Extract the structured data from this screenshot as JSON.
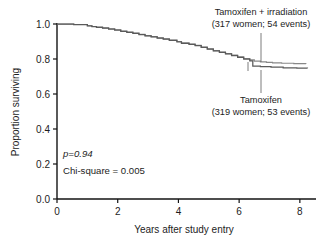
{
  "chart_data": {
    "type": "line",
    "title": "",
    "subtitle": "",
    "xlabel": "Years after study entry",
    "ylabel": "Proportion surviving",
    "xlim": [
      0,
      8.4
    ],
    "ylim": [
      0.0,
      1.04
    ],
    "xticks": [
      "0",
      "2",
      "4",
      "6",
      "8"
    ],
    "xtick_values": [
      0,
      2,
      4,
      6,
      8
    ],
    "yticks": [
      "0.0",
      "0.2",
      "0.4",
      "0.6",
      "0.8",
      "1.0"
    ],
    "ytick_values": [
      0.0,
      0.2,
      0.4,
      0.6,
      0.8,
      1.0
    ],
    "grid": false,
    "legend_position": "inline-annotations",
    "annotations": [
      {
        "name": "tamoxifen-irradiation-label",
        "line1": "Tamoxifen + irradiation",
        "line2": "(317 women; 54 events)",
        "n_women": 317,
        "n_events": 54
      },
      {
        "name": "tamoxifen-label",
        "line1": "Tamoxifen",
        "line2": "(319 women; 53 events)",
        "n_women": 319,
        "n_events": 53
      }
    ],
    "statistics": {
      "p_value_label": "p=0.94",
      "p_value": 0.94,
      "chi_square_label": "Chi-square = 0.005",
      "chi_square": 0.005
    },
    "series": [
      {
        "name": "Tamoxifen + irradiation",
        "color": "#5a5a5a",
        "points": [
          [
            0.0,
            1.0
          ],
          [
            0.45,
            1.0
          ],
          [
            0.55,
            0.997
          ],
          [
            0.9,
            0.997
          ],
          [
            1.0,
            0.99
          ],
          [
            1.15,
            0.986
          ],
          [
            1.3,
            0.983
          ],
          [
            1.5,
            0.978
          ],
          [
            1.7,
            0.973
          ],
          [
            1.9,
            0.967
          ],
          [
            2.1,
            0.96
          ],
          [
            2.3,
            0.954
          ],
          [
            2.5,
            0.948
          ],
          [
            2.7,
            0.941
          ],
          [
            2.9,
            0.934
          ],
          [
            3.1,
            0.928
          ],
          [
            3.3,
            0.921
          ],
          [
            3.5,
            0.915
          ],
          [
            3.7,
            0.908
          ],
          [
            3.95,
            0.9
          ],
          [
            4.1,
            0.892
          ],
          [
            4.35,
            0.885
          ],
          [
            4.55,
            0.878
          ],
          [
            4.75,
            0.868
          ],
          [
            4.95,
            0.858
          ],
          [
            5.15,
            0.848
          ],
          [
            5.35,
            0.84
          ],
          [
            5.55,
            0.831
          ],
          [
            5.75,
            0.822
          ],
          [
            5.95,
            0.812
          ],
          [
            6.15,
            0.803
          ],
          [
            6.35,
            0.795
          ],
          [
            6.5,
            0.788
          ],
          [
            6.7,
            0.784
          ],
          [
            6.9,
            0.781
          ],
          [
            7.1,
            0.778
          ],
          [
            7.4,
            0.776
          ],
          [
            7.8,
            0.774
          ],
          [
            8.2,
            0.773
          ]
        ]
      },
      {
        "name": "Tamoxifen",
        "color": "#7d7d7d",
        "points": [
          [
            0.0,
            1.0
          ],
          [
            0.45,
            1.0
          ],
          [
            0.55,
            0.996
          ],
          [
            0.9,
            0.996
          ],
          [
            1.0,
            0.989
          ],
          [
            1.15,
            0.985
          ],
          [
            1.3,
            0.981
          ],
          [
            1.5,
            0.976
          ],
          [
            1.7,
            0.971
          ],
          [
            1.9,
            0.965
          ],
          [
            2.1,
            0.958
          ],
          [
            2.3,
            0.952
          ],
          [
            2.5,
            0.946
          ],
          [
            2.7,
            0.939
          ],
          [
            2.9,
            0.932
          ],
          [
            3.1,
            0.926
          ],
          [
            3.3,
            0.919
          ],
          [
            3.5,
            0.913
          ],
          [
            3.7,
            0.906
          ],
          [
            3.95,
            0.898
          ],
          [
            4.1,
            0.89
          ],
          [
            4.35,
            0.883
          ],
          [
            4.55,
            0.876
          ],
          [
            4.75,
            0.866
          ],
          [
            4.95,
            0.856
          ],
          [
            5.15,
            0.846
          ],
          [
            5.35,
            0.838
          ],
          [
            5.55,
            0.829
          ],
          [
            5.75,
            0.82
          ],
          [
            5.95,
            0.81
          ],
          [
            6.15,
            0.8
          ],
          [
            6.35,
            0.79
          ],
          [
            6.45,
            0.76
          ],
          [
            6.7,
            0.757
          ],
          [
            7.05,
            0.753
          ],
          [
            7.45,
            0.75
          ],
          [
            7.9,
            0.748
          ],
          [
            8.25,
            0.747
          ]
        ]
      }
    ]
  }
}
